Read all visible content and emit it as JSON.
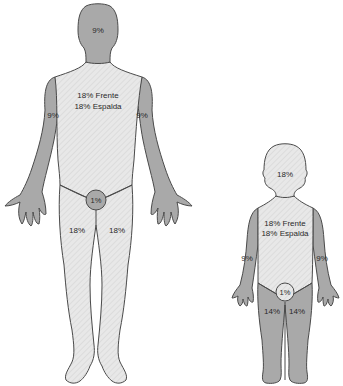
{
  "diagram": {
    "colors": {
      "dark_region": "#a9a9a9",
      "light_region": "#e6e6e6",
      "outline": "#4a4a4a",
      "text": "#2a2a2a"
    },
    "adult": {
      "head": "9%",
      "trunk_front": "18% Frente",
      "trunk_back": "18% Espalda",
      "arm_right": "9%",
      "arm_left": "9%",
      "genitals": "1%",
      "leg_right": "18%",
      "leg_left": "18%"
    },
    "child": {
      "head": "18%",
      "trunk_front": "18% Frente",
      "trunk_back": "18% Espalda",
      "arm_right": "9%",
      "arm_left": "9%",
      "genitals": "1%",
      "leg_right": "14%",
      "leg_left": "14%"
    }
  }
}
